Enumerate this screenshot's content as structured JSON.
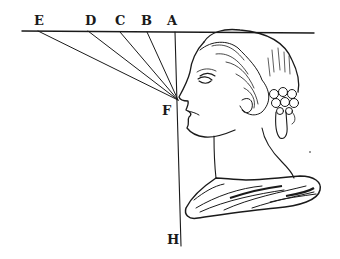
{
  "figure": {
    "type": "perspective-engraving",
    "ink_color": "#1a1a1a",
    "background": "#ffffff",
    "horizon_line": {
      "x1": 22,
      "y1": 31,
      "x2": 314,
      "y2": 33
    },
    "vertical_line": {
      "x1": 175,
      "y1": 32,
      "x2": 181,
      "y2": 246
    },
    "convergence_point": {
      "label": "F",
      "x": 178,
      "y": 100
    },
    "labels": [
      {
        "id": "E",
        "text": "E",
        "x": 34,
        "y": 14
      },
      {
        "id": "D",
        "text": "D",
        "x": 85,
        "y": 14
      },
      {
        "id": "C",
        "text": "C",
        "x": 115,
        "y": 14
      },
      {
        "id": "B",
        "text": "B",
        "x": 141,
        "y": 14
      },
      {
        "id": "A",
        "text": "A",
        "x": 167,
        "y": 14
      },
      {
        "id": "F",
        "text": "F",
        "x": 162,
        "y": 104
      },
      {
        "id": "H",
        "text": "H",
        "x": 167,
        "y": 233
      }
    ],
    "sight_lines": [
      {
        "from": "E",
        "x1": 38,
        "y1": 31,
        "x2": 178,
        "y2": 100
      },
      {
        "from": "D",
        "x1": 88,
        "y1": 31,
        "x2": 178,
        "y2": 100
      },
      {
        "from": "C",
        "x1": 120,
        "y1": 32,
        "x2": 178,
        "y2": 100
      },
      {
        "from": "B",
        "x1": 147,
        "y1": 32,
        "x2": 178,
        "y2": 100
      },
      {
        "from": "A",
        "x1": 175,
        "y1": 32,
        "x2": 178,
        "y2": 100
      }
    ]
  }
}
